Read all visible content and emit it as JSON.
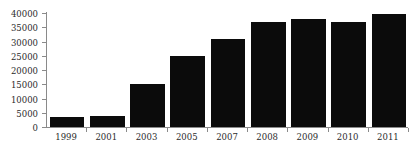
{
  "chart_data": {
    "type": "bar",
    "title": "",
    "subtitle": "",
    "xlabel": "",
    "ylabel": "",
    "categories": [
      "1999",
      "2001",
      "2003",
      "2005",
      "2007",
      "2008",
      "2009",
      "2010",
      "2011"
    ],
    "values": [
      3500,
      3800,
      15000,
      25000,
      31000,
      37000,
      38000,
      37000,
      39500
    ],
    "series": [
      {
        "name": "",
        "values": [
          3500,
          3800,
          15000,
          25000,
          31000,
          37000,
          38000,
          37000,
          39500
        ]
      }
    ],
    "ylim": [
      0,
      40000
    ],
    "ytick_labels": [
      "0",
      "5000",
      "10000",
      "15000",
      "20000",
      "25000",
      "30000",
      "35000",
      "40000"
    ],
    "ytick_values": [
      0,
      5000,
      10000,
      15000,
      20000,
      25000,
      30000,
      35000,
      40000
    ],
    "grid": false,
    "legend": null,
    "legend_position": "none",
    "bar_color": "#0b0b0b",
    "axis_color": "#8a8a8a",
    "background_color": "#ffffff",
    "annotations": []
  }
}
